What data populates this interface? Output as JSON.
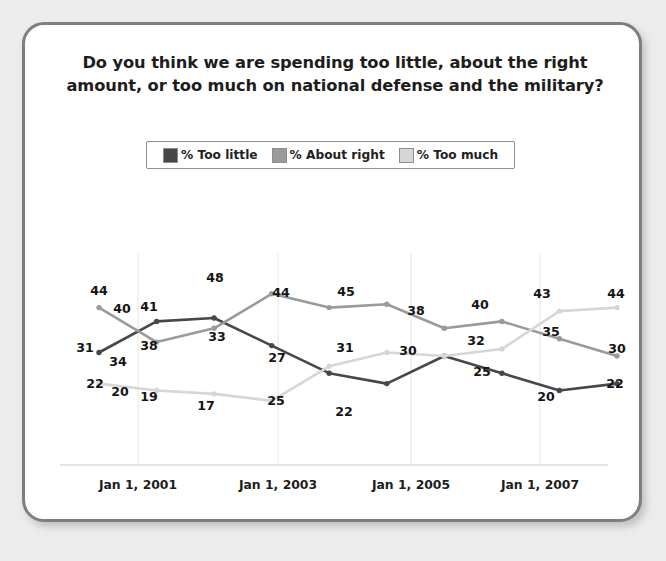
{
  "card": {
    "title": "Do you think we are spending too little, about the right amount, or too much on national defense and the military?"
  },
  "legend": {
    "position": "top-center",
    "entries": [
      {
        "label": "% Too little",
        "color": "#474747",
        "swatch": "legend-swatch-too-little"
      },
      {
        "label": "% About right",
        "color": "#9a9a9a",
        "swatch": "legend-swatch-about-right"
      },
      {
        "label": "% Too much",
        "color": "#d6d6d6",
        "swatch": "legend-swatch-too-much"
      }
    ]
  },
  "chart_data": {
    "type": "line",
    "title": "Do you think we are spending too little, about the right amount, or too much on national defense and the military?",
    "xlabel": "",
    "ylabel": "",
    "ylim": [
      10,
      52
    ],
    "grid": true,
    "gridlines_x": [
      "Jan 1, 2001",
      "Jan 1, 2003",
      "Jan 1, 2005",
      "Jan 1, 2007"
    ],
    "legend_position": "top-center",
    "x": [
      0,
      1,
      2,
      3,
      4,
      5,
      6,
      7,
      8,
      9
    ],
    "tick_labels": [
      "Jan 1, 2001",
      "Jan 1, 2003",
      "Jan 1, 2005",
      "Jan 1, 2007"
    ],
    "tick_positions": [
      2,
      4,
      6,
      8
    ],
    "series": [
      {
        "name": "% Too little",
        "color": "#474747",
        "values": [
          31,
          40,
          41,
          33,
          25,
          22,
          30,
          25,
          20,
          22
        ],
        "label_side": [
          "left",
          "above",
          "above",
          "above",
          "below",
          "below",
          "above",
          "above",
          "above",
          "above"
        ]
      },
      {
        "name": "% About right",
        "color": "#9a9a9a",
        "values": [
          44,
          34,
          38,
          48,
          44,
          45,
          38,
          40,
          35,
          30
        ],
        "label_side": [
          "above",
          "below",
          "below",
          "above",
          "above",
          "above",
          "above",
          "above",
          "above",
          "above"
        ]
      },
      {
        "name": "% Too much",
        "color": "#d6d6d6",
        "values": [
          22,
          20,
          19,
          17,
          27,
          31,
          30,
          32,
          43,
          44
        ],
        "label_side": [
          "above",
          "above",
          "above",
          "above",
          "above",
          "above",
          "above",
          "above",
          "above",
          "above"
        ]
      }
    ],
    "point_labels": [
      {
        "text": "44",
        "x": 74,
        "y": 265,
        "series": "% About right"
      },
      {
        "text": "40",
        "x": 97,
        "y": 283,
        "series": "% Too little"
      },
      {
        "text": "41",
        "x": 124,
        "y": 281,
        "series": "% Too little"
      },
      {
        "text": "31",
        "x": 60,
        "y": 322,
        "series": "% Too little"
      },
      {
        "text": "34",
        "x": 93,
        "y": 336,
        "series": "% About right"
      },
      {
        "text": "38",
        "x": 124,
        "y": 320,
        "series": "% About right"
      },
      {
        "text": "22",
        "x": 70,
        "y": 358,
        "series": "% Too much"
      },
      {
        "text": "20",
        "x": 95,
        "y": 366,
        "series": "% Too much"
      },
      {
        "text": "19",
        "x": 124,
        "y": 371,
        "series": "% Too much"
      },
      {
        "text": "48",
        "x": 190,
        "y": 252,
        "series": "% About right"
      },
      {
        "text": "33",
        "x": 192,
        "y": 311,
        "series": "% Too little"
      },
      {
        "text": "17",
        "x": 181,
        "y": 380,
        "series": "% Too much"
      },
      {
        "text": "44",
        "x": 256,
        "y": 267,
        "series": "% About right"
      },
      {
        "text": "27",
        "x": 252,
        "y": 332,
        "series": "% Too much"
      },
      {
        "text": "25",
        "x": 251,
        "y": 375,
        "series": "% Too little"
      },
      {
        "text": "45",
        "x": 321,
        "y": 266,
        "series": "% About right"
      },
      {
        "text": "31",
        "x": 320,
        "y": 322,
        "series": "% Too much"
      },
      {
        "text": "22",
        "x": 319,
        "y": 386,
        "series": "% Too little"
      },
      {
        "text": "38",
        "x": 391,
        "y": 285,
        "series": "% About right"
      },
      {
        "text": "30",
        "x": 383,
        "y": 325,
        "series": "% Too little"
      },
      {
        "text": "40",
        "x": 455,
        "y": 279,
        "series": "% About right"
      },
      {
        "text": "32",
        "x": 451,
        "y": 315,
        "series": "% Too much"
      },
      {
        "text": "25",
        "x": 457,
        "y": 346,
        "series": "% Too little"
      },
      {
        "text": "43",
        "x": 517,
        "y": 268,
        "series": "% Too much"
      },
      {
        "text": "35",
        "x": 526,
        "y": 306,
        "series": "% About right"
      },
      {
        "text": "20",
        "x": 521,
        "y": 371,
        "series": "% Too little"
      },
      {
        "text": "44",
        "x": 591,
        "y": 268,
        "series": "% Too much"
      },
      {
        "text": "30",
        "x": 592,
        "y": 323,
        "series": "% About right"
      },
      {
        "text": "22",
        "x": 590,
        "y": 358,
        "series": "% Too little"
      }
    ]
  },
  "axis": {
    "ticks": [
      {
        "label": "Jan 1, 2001",
        "x": 113
      },
      {
        "label": "Jan 1, 2003",
        "x": 253
      },
      {
        "label": "Jan 1, 2005",
        "x": 386
      },
      {
        "label": "Jan 1, 2007",
        "x": 515
      }
    ]
  }
}
